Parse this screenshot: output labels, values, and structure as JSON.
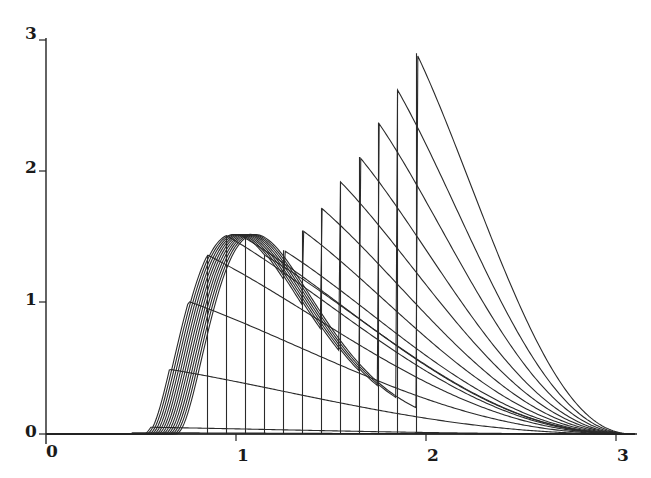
{
  "chart_data": {
    "type": "line",
    "title": "",
    "xlabel": "",
    "ylabel": "",
    "xlim": [
      0,
      3.1
    ],
    "ylim": [
      0,
      3
    ],
    "grid": false,
    "legend": null,
    "x_ticks": [
      "0",
      "1",
      "2",
      "3"
    ],
    "y_ticks": [
      "0",
      "1",
      "2",
      "3"
    ],
    "cutoffs": [
      0.35,
      0.45,
      0.55,
      0.65,
      0.75,
      0.85,
      0.95,
      1.05,
      1.15,
      1.25,
      1.35,
      1.45,
      1.55,
      1.65,
      1.75,
      1.85,
      1.95
    ],
    "peak_at_cutoff": [
      0.0,
      0.0,
      0.01,
      0.03,
      0.08,
      0.22,
      0.45,
      0.75,
      1.05,
      1.25,
      1.4,
      1.55,
      1.72,
      1.92,
      2.11,
      2.37,
      2.62,
      2.9
    ],
    "left_peak": {
      "x": 1.17,
      "y": 1.52
    },
    "series": [
      {
        "name": "c=0.35",
        "cutoff": 0.35,
        "peak": 1.52
      },
      {
        "name": "c=0.45",
        "cutoff": 0.45,
        "peak": 1.52
      },
      {
        "name": "c=0.55",
        "cutoff": 0.55,
        "peak": 1.52
      },
      {
        "name": "c=0.65",
        "cutoff": 0.65,
        "peak": 1.52
      },
      {
        "name": "c=0.75",
        "cutoff": 0.75,
        "peak": 1.52
      },
      {
        "name": "c=0.85",
        "cutoff": 0.85,
        "peak": 1.5
      },
      {
        "name": "c=0.95",
        "cutoff": 0.95,
        "peak": 1.48
      },
      {
        "name": "c=1.05",
        "cutoff": 1.05,
        "peak": 1.46
      },
      {
        "name": "c=1.15",
        "cutoff": 1.15,
        "peak": 1.44
      },
      {
        "name": "c=1.25",
        "cutoff": 1.25,
        "peak": 1.43
      },
      {
        "name": "c=1.35",
        "cutoff": 1.35,
        "peak": 1.5
      },
      {
        "name": "c=1.45",
        "cutoff": 1.45,
        "peak": 1.62
      },
      {
        "name": "c=1.55",
        "cutoff": 1.55,
        "peak": 1.92
      },
      {
        "name": "c=1.65",
        "cutoff": 1.65,
        "peak": 2.11
      },
      {
        "name": "c=1.75",
        "cutoff": 1.75,
        "peak": 2.37
      },
      {
        "name": "c=1.85",
        "cutoff": 1.85,
        "peak": 2.62
      },
      {
        "name": "c=1.95",
        "cutoff": 1.95,
        "peak": 2.9
      }
    ]
  },
  "axes": {
    "x_tick_labels": [
      "0",
      "1",
      "2",
      "3"
    ],
    "y_tick_labels": [
      "0",
      "1",
      "2",
      "3"
    ]
  }
}
